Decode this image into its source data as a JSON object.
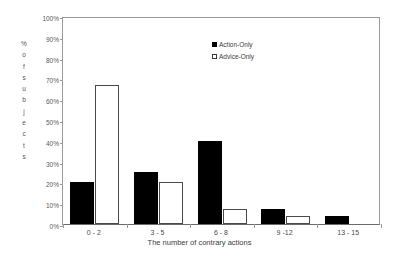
{
  "chart_data": {
    "type": "bar",
    "title": "",
    "xlabel": "The number of contrary actions",
    "ylabel": "% of subjects",
    "ylabel_chars": [
      "%",
      "o",
      "f",
      "s",
      "u",
      "b",
      "j",
      "e",
      "c",
      "t",
      "s"
    ],
    "categories": [
      "0 - 2",
      "3 - 5",
      "6 - 8",
      "9 -12",
      "13 - 15"
    ],
    "series": [
      {
        "name": "Action-Only",
        "values": [
          20,
          25,
          40,
          7,
          4
        ],
        "color": "#000000",
        "style": "filled"
      },
      {
        "name": "Advice-Only",
        "values": [
          67,
          20,
          7,
          4,
          0
        ],
        "color": "#ffffff",
        "style": "outlined"
      }
    ],
    "ylim": [
      0,
      100
    ],
    "ytick_labels": [
      "0%",
      "10%",
      "20%",
      "30%",
      "40%",
      "50%",
      "60%",
      "70%",
      "80%",
      "90%",
      "100%"
    ],
    "ytick_values": [
      0,
      10,
      20,
      30,
      40,
      50,
      60,
      70,
      80,
      90,
      100
    ],
    "grid": false,
    "legend_position": "top-center-right"
  }
}
